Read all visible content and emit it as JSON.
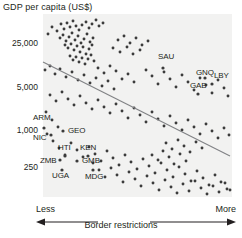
{
  "chart_data": {
    "type": "scatter",
    "title": "GDP per capita (US$)",
    "xlabel": "Border restrictions",
    "ylabel": "GDP per capita (US$)",
    "x_axis_low_label": "Less",
    "x_axis_high_label": "More",
    "y_scale": "log",
    "y_ticks": [
      {
        "label": "25,000",
        "value": 25000,
        "y": 44
      },
      {
        "label": "5,000",
        "value": 5000,
        "y": 88
      },
      {
        "label": "1,000",
        "value": 1000,
        "y": 131
      },
      {
        "label": "250",
        "value": 250,
        "y": 168
      }
    ],
    "grid": false,
    "legend": "none",
    "trendline": {
      "x1": 43,
      "y1": 62,
      "x2": 230,
      "y2": 156,
      "color": "#808285"
    },
    "annotations": [
      {
        "label": "SAU",
        "x": 158,
        "y": 57,
        "px": 163,
        "py": 68
      },
      {
        "label": "GNQ",
        "x": 196,
        "y": 73,
        "px": 205,
        "py": 78
      },
      {
        "label": "LBY",
        "x": 214,
        "y": 76,
        "px": 212,
        "py": 84
      },
      {
        "label": "GAB",
        "x": 190,
        "y": 86,
        "px": 198,
        "py": 94
      },
      {
        "label": "ARM",
        "x": 33,
        "y": 118,
        "px": 44,
        "py": 128
      },
      {
        "label": "GEO",
        "x": 68,
        "y": 131,
        "px": 63,
        "py": 131
      },
      {
        "label": "NIC",
        "x": 33,
        "y": 138,
        "px": 51,
        "py": 135
      },
      {
        "label": "HTI",
        "x": 58,
        "y": 148,
        "px": 65,
        "py": 156
      },
      {
        "label": "KEN",
        "x": 80,
        "y": 148,
        "px": 88,
        "py": 156
      },
      {
        "label": "ZMB",
        "x": 40,
        "y": 161,
        "px": 60,
        "py": 160
      },
      {
        "label": "GMB",
        "x": 82,
        "y": 161,
        "px": 77,
        "py": 161
      },
      {
        "label": "UGA",
        "x": 52,
        "y": 176,
        "px": 62,
        "py": 170
      },
      {
        "label": "MDG",
        "x": 85,
        "y": 177,
        "px": 93,
        "py": 170
      }
    ],
    "points": [
      [
        48,
        34
      ],
      [
        52,
        27
      ],
      [
        57,
        31
      ],
      [
        61,
        24
      ],
      [
        64,
        29
      ],
      [
        67,
        23
      ],
      [
        70,
        27
      ],
      [
        73,
        21
      ],
      [
        76,
        26
      ],
      [
        79,
        30
      ],
      [
        82,
        25
      ],
      [
        86,
        22
      ],
      [
        89,
        28
      ],
      [
        92,
        24
      ],
      [
        96,
        20
      ],
      [
        99,
        26
      ],
      [
        103,
        23
      ],
      [
        60,
        38
      ],
      [
        63,
        35
      ],
      [
        66,
        41
      ],
      [
        69,
        37
      ],
      [
        72,
        33
      ],
      [
        75,
        40
      ],
      [
        78,
        36
      ],
      [
        81,
        43
      ],
      [
        84,
        39
      ],
      [
        87,
        34
      ],
      [
        90,
        42
      ],
      [
        93,
        38
      ],
      [
        65,
        45
      ],
      [
        68,
        48
      ],
      [
        71,
        44
      ],
      [
        74,
        50
      ],
      [
        77,
        46
      ],
      [
        80,
        52
      ],
      [
        83,
        47
      ],
      [
        86,
        54
      ],
      [
        89,
        49
      ],
      [
        92,
        45
      ],
      [
        70,
        56
      ],
      [
        73,
        60
      ],
      [
        76,
        57
      ],
      [
        79,
        62
      ],
      [
        82,
        58
      ],
      [
        85,
        64
      ],
      [
        88,
        59
      ],
      [
        91,
        55
      ],
      [
        94,
        61
      ],
      [
        118,
        40
      ],
      [
        124,
        36
      ],
      [
        130,
        43
      ],
      [
        136,
        38
      ],
      [
        142,
        45
      ],
      [
        148,
        41
      ],
      [
        113,
        48
      ],
      [
        120,
        52
      ],
      [
        127,
        47
      ],
      [
        133,
        54
      ],
      [
        140,
        50
      ],
      [
        45,
        70
      ],
      [
        50,
        66
      ],
      [
        55,
        74
      ],
      [
        60,
        69
      ],
      [
        66,
        77
      ],
      [
        72,
        72
      ],
      [
        78,
        80
      ],
      [
        84,
        75
      ],
      [
        90,
        83
      ],
      [
        96,
        78
      ],
      [
        102,
        86
      ],
      [
        108,
        81
      ],
      [
        114,
        89
      ],
      [
        98,
        68
      ],
      [
        104,
        73
      ],
      [
        110,
        66
      ],
      [
        116,
        71
      ],
      [
        122,
        79
      ],
      [
        128,
        74
      ],
      [
        134,
        82
      ],
      [
        146,
        70
      ],
      [
        152,
        76
      ],
      [
        158,
        84
      ],
      [
        164,
        72
      ],
      [
        170,
        79
      ],
      [
        176,
        87
      ],
      [
        182,
        75
      ],
      [
        188,
        82
      ],
      [
        194,
        90
      ],
      [
        200,
        78
      ],
      [
        206,
        85
      ],
      [
        212,
        93
      ],
      [
        218,
        80
      ],
      [
        224,
        88
      ],
      [
        228,
        96
      ],
      [
        50,
        95
      ],
      [
        56,
        101
      ],
      [
        62,
        92
      ],
      [
        68,
        99
      ],
      [
        74,
        105
      ],
      [
        80,
        96
      ],
      [
        86,
        103
      ],
      [
        92,
        109
      ],
      [
        98,
        100
      ],
      [
        104,
        107
      ],
      [
        110,
        113
      ],
      [
        116,
        104
      ],
      [
        122,
        111
      ],
      [
        128,
        118
      ],
      [
        134,
        108
      ],
      [
        140,
        115
      ],
      [
        146,
        122
      ],
      [
        152,
        112
      ],
      [
        158,
        119
      ],
      [
        164,
        126
      ],
      [
        170,
        116
      ],
      [
        176,
        123
      ],
      [
        182,
        130
      ],
      [
        188,
        120
      ],
      [
        194,
        127
      ],
      [
        200,
        134
      ],
      [
        206,
        124
      ],
      [
        212,
        131
      ],
      [
        218,
        138
      ],
      [
        224,
        128
      ],
      [
        229,
        135
      ],
      [
        46,
        112
      ],
      [
        52,
        120
      ],
      [
        58,
        127
      ],
      [
        47,
        134
      ],
      [
        53,
        141
      ],
      [
        59,
        148
      ],
      [
        65,
        155
      ],
      [
        71,
        143
      ],
      [
        77,
        150
      ],
      [
        83,
        157
      ],
      [
        89,
        147
      ],
      [
        95,
        154
      ],
      [
        101,
        161
      ],
      [
        107,
        151
      ],
      [
        113,
        158
      ],
      [
        119,
        165
      ],
      [
        125,
        155
      ],
      [
        131,
        162
      ],
      [
        137,
        169
      ],
      [
        143,
        159
      ],
      [
        149,
        166
      ],
      [
        155,
        173
      ],
      [
        161,
        163
      ],
      [
        167,
        170
      ],
      [
        173,
        177
      ],
      [
        179,
        167
      ],
      [
        185,
        174
      ],
      [
        191,
        181
      ],
      [
        197,
        171
      ],
      [
        203,
        178
      ],
      [
        209,
        185
      ],
      [
        215,
        175
      ],
      [
        221,
        182
      ],
      [
        227,
        189
      ],
      [
        93,
        163
      ],
      [
        99,
        170
      ],
      [
        105,
        177
      ],
      [
        111,
        168
      ],
      [
        117,
        175
      ],
      [
        123,
        182
      ],
      [
        129,
        172
      ],
      [
        135,
        179
      ],
      [
        141,
        186
      ],
      [
        147,
        176
      ],
      [
        153,
        183
      ],
      [
        159,
        190
      ],
      [
        165,
        180
      ],
      [
        171,
        187
      ],
      [
        177,
        193
      ],
      [
        183,
        184
      ],
      [
        189,
        191
      ],
      [
        195,
        181
      ],
      [
        201,
        188
      ],
      [
        207,
        194
      ],
      [
        213,
        186
      ],
      [
        219,
        192
      ],
      [
        225,
        183
      ],
      [
        230,
        190
      ],
      [
        152,
        155
      ],
      [
        158,
        160
      ],
      [
        163,
        151
      ],
      [
        169,
        157
      ],
      [
        174,
        164
      ],
      [
        180,
        154
      ],
      [
        186,
        161
      ],
      [
        166,
        143
      ],
      [
        172,
        149
      ],
      [
        178,
        140
      ],
      [
        184,
        146
      ],
      [
        190,
        152
      ],
      [
        196,
        142
      ],
      [
        202,
        148
      ]
    ],
    "point_color": "#3b3b3b",
    "plot_bg": "#f2f2f1",
    "plot_rect": {
      "x": 43,
      "y": 14,
      "w": 189,
      "h": 183
    }
  }
}
